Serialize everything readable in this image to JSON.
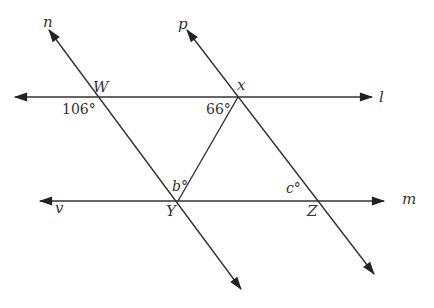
{
  "diagram": {
    "type": "parallel lines cut by transversals",
    "lines": {
      "l": {
        "label": "l",
        "orientation": "horizontal"
      },
      "m": {
        "label": "m",
        "orientation": "horizontal"
      },
      "v": {
        "label": "v"
      },
      "n": {
        "label": "n",
        "orientation": "transversal"
      },
      "p": {
        "label": "p",
        "orientation": "transversal"
      }
    },
    "points": {
      "W": "W",
      "x": "x",
      "Y": "Y",
      "Z": "Z"
    },
    "angles": {
      "at_W": "106°",
      "at_x": "66°",
      "at_Y": "b°",
      "at_Z": "c°"
    },
    "stroke_color": "#333333",
    "background": "#ffffff"
  }
}
